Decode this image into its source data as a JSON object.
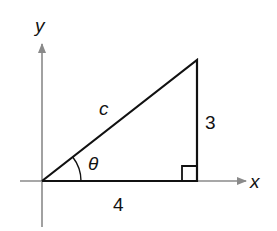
{
  "diagram": {
    "axes": {
      "x_label": "x",
      "y_label": "y"
    },
    "triangle": {
      "hypotenuse_label": "c",
      "opposite_label": "3",
      "adjacent_label": "4",
      "angle_label": "θ",
      "right_angle_marker": true
    },
    "colors": {
      "lines": "#111111",
      "axes": "#888888"
    }
  }
}
